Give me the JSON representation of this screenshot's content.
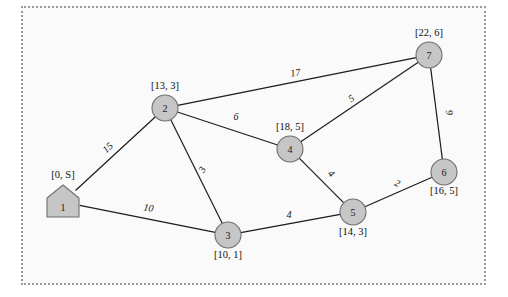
{
  "diagram": {
    "background_color": "#fafafa",
    "border_color": "#9a9a9a",
    "node_fill": "#c6c6c6",
    "node_stroke": "#6f6f6f",
    "edge_color": "#1c1c1c"
  },
  "nodes": [
    {
      "id": "1",
      "label": "[0, S]",
      "shape": "pentagon-house",
      "x": 63,
      "y": 202,
      "label_x": 63,
      "label_y": 178
    },
    {
      "id": "2",
      "label": "[13, 3]",
      "shape": "circle",
      "x": 165,
      "y": 108,
      "label_x": 165,
      "label_y": 89
    },
    {
      "id": "3",
      "label": "[10, 1]",
      "shape": "circle",
      "x": 228,
      "y": 235,
      "label_x": 228,
      "label_y": 258
    },
    {
      "id": "4",
      "label": "[18, 5]",
      "shape": "circle",
      "x": 290,
      "y": 149,
      "label_x": 290,
      "label_y": 130
    },
    {
      "id": "5",
      "label": "[14, 3]",
      "shape": "circle",
      "x": 353,
      "y": 212,
      "label_x": 353,
      "label_y": 235
    },
    {
      "id": "6",
      "label": "[16, 5]",
      "shape": "circle",
      "x": 444,
      "y": 172,
      "label_x": 444,
      "label_y": 194
    },
    {
      "id": "7",
      "label": "[22, 6]",
      "shape": "circle",
      "x": 429,
      "y": 55,
      "label_x": 429,
      "label_y": 36
    }
  ],
  "edges": [
    {
      "from": "1",
      "to": "2",
      "weight": "15",
      "label_x": 110,
      "label_y": 150,
      "label_rotation": -43
    },
    {
      "from": "1",
      "to": "3",
      "weight": "10",
      "label_x": 148,
      "label_y": 211,
      "label_rotation": 10
    },
    {
      "from": "2",
      "to": "3",
      "weight": "3",
      "label_x": 205,
      "label_y": 171,
      "label_rotation": -64
    },
    {
      "from": "2",
      "to": "4",
      "weight": "6",
      "label_x": 236,
      "label_y": 120,
      "label_rotation": 0
    },
    {
      "from": "2",
      "to": "7",
      "weight": "17",
      "label_x": 296,
      "label_y": 76,
      "label_rotation": -10
    },
    {
      "from": "3",
      "to": "5",
      "weight": "4",
      "label_x": 289,
      "label_y": 218,
      "label_rotation": 0
    },
    {
      "from": "4",
      "to": "5",
      "weight": "4",
      "label_x": 329,
      "label_y": 176,
      "label_rotation": 44
    },
    {
      "from": "4",
      "to": "7",
      "weight": "5",
      "label_x": 353,
      "label_y": 101,
      "label_rotation": -34
    },
    {
      "from": "5",
      "to": "6",
      "weight": "2",
      "label_x": 396,
      "label_y": 186,
      "label_rotation": 24
    },
    {
      "from": "6",
      "to": "7",
      "weight": "9",
      "label_x": 446,
      "label_y": 113,
      "label_rotation": 82
    }
  ]
}
